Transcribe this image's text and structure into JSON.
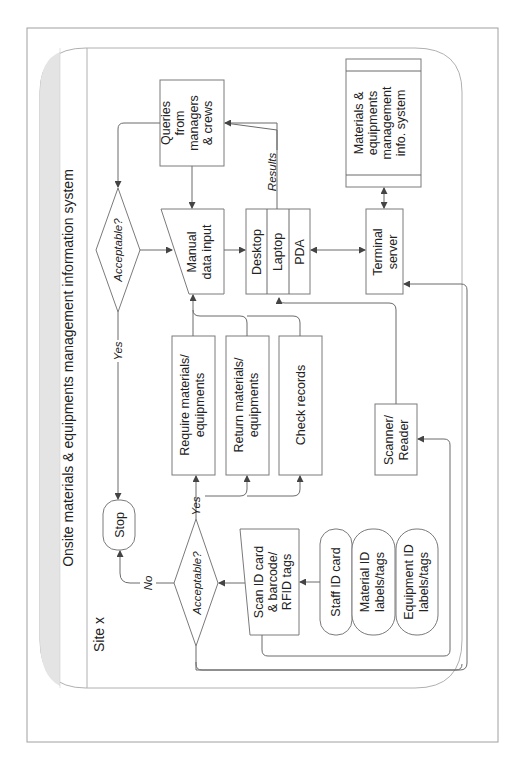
{
  "diagram": {
    "title": "Onsite materials & equipments management information system",
    "site_label": "Site x",
    "nodes": {
      "queries": [
        "Queries",
        "from",
        "managers",
        "& crews"
      ],
      "acceptable_top": "Acceptable?",
      "manual_input": [
        "Manual",
        "data input"
      ],
      "devices": [
        "Desktop",
        "Laptop",
        "PDA"
      ],
      "info_system": [
        "Materials &",
        "equipments",
        "management",
        "info. system"
      ],
      "terminal_server": [
        "Terminal",
        "server"
      ],
      "require": [
        "Require materials/",
        "equipments"
      ],
      "return": [
        "Return materials/",
        "equipments"
      ],
      "check": "Check records",
      "scanner": [
        "Scanner/",
        "Reader"
      ],
      "stop": "Stop",
      "acceptable_bottom": "Acceptable?",
      "scan": [
        "Scan ID card",
        "& barcode/",
        "RFID tags"
      ],
      "staff_card": "Staff ID card",
      "material_id": [
        "Material ID",
        "labels/tags"
      ],
      "equipment_id": [
        "Equipment ID",
        "labels/tags"
      ]
    },
    "edge_labels": {
      "results": "Results",
      "yes_top": "Yes",
      "yes_bottom": "Yes",
      "no": "No"
    },
    "colors": {
      "line": "#6b6b6b",
      "title_band": "#e4e4e4",
      "border": "#9a9a9a"
    }
  }
}
